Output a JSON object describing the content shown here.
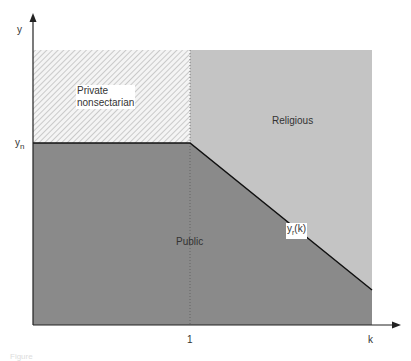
{
  "diagram": {
    "axes": {
      "y_label": "y",
      "x_label": "k",
      "y_tick": "y",
      "y_tick_sub": "n",
      "x_tick": "1"
    },
    "regions": [
      {
        "name": "Private nonsectarian",
        "line1": "Private",
        "line2": "nonsectarian",
        "fill": "hatched",
        "color": "#f2f2f2"
      },
      {
        "name": "Religious",
        "label": "Religious",
        "fill": "light-gray",
        "color": "#c4c4c4"
      },
      {
        "name": "Public",
        "label": "Public",
        "fill": "dark-gray",
        "color": "#8a8a8a"
      }
    ],
    "curve": {
      "label_main": "y",
      "label_sub": "r",
      "label_arg": "(k)"
    },
    "caption": "Figure"
  },
  "colors": {
    "axis": "#222222",
    "public": "#8a8a8a",
    "religious": "#c4c4c4",
    "hatch_bg": "#f4f4f4",
    "hatch_line": "#9a9a9a",
    "boundary": "#111111"
  }
}
